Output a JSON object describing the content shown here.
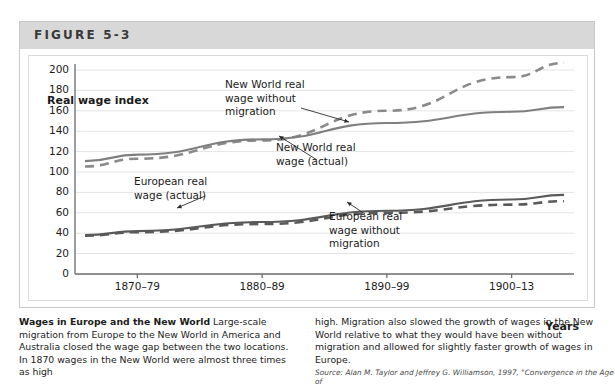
{
  "figure": {
    "label": "FIGURE 5-3"
  },
  "chart_data": {
    "type": "line",
    "title": "",
    "xlabel": "Years",
    "ylabel": "Real wage index",
    "categories": [
      "1870–79",
      "1880–89",
      "1890–99",
      "1900–13"
    ],
    "ylim": [
      0,
      200
    ],
    "ytick_step": 20,
    "yticks": [
      200,
      180,
      160,
      140,
      120,
      100,
      80,
      60,
      40,
      20,
      0
    ],
    "grid": true,
    "legend_position": "inline-annotations",
    "series": [
      {
        "name": "New World real wage without migration",
        "style": "dashed",
        "color": "#8a8a8a",
        "values": [
          113,
          131,
          160,
          193
        ]
      },
      {
        "name": "New World real wage (actual)",
        "style": "solid",
        "color": "#7f7f7f",
        "values": [
          117,
          132,
          148,
          159
        ]
      },
      {
        "name": "European real wage (actual)",
        "style": "solid",
        "color": "#5a5a5a",
        "values": [
          42,
          51,
          62,
          73
        ]
      },
      {
        "name": "European real wage without migration",
        "style": "dashed",
        "color": "#595959",
        "values": [
          41,
          49,
          60,
          68
        ]
      }
    ],
    "annotations": [
      {
        "id": "nw-without",
        "text": "New World real\nwage without\nmigration"
      },
      {
        "id": "nw-actual",
        "text": "New World real\nwage (actual)"
      },
      {
        "id": "eu-actual",
        "text": "European real\nwage (actual)"
      },
      {
        "id": "eu-without",
        "text": "European real\nwage without\nmigration"
      }
    ]
  },
  "axis": {
    "y_title": "Real wage\nindex",
    "x_title": "Years",
    "y_ticks": [
      "200",
      "180",
      "160",
      "140",
      "120",
      "100",
      "80",
      "60",
      "40",
      "20",
      "0"
    ],
    "x_ticks": [
      "1870–79",
      "1880–89",
      "1890–99",
      "1900–13"
    ]
  },
  "caption": {
    "title": "Wages in Europe and the New World",
    "left_text": " Large-scale migration from Europe to the New World in America and Australia closed the wage gap between the two locations. In 1870 wages in the New World were almost three times as high",
    "right_text": "high. Migration also slowed the growth of wages in the New World relative to what they would have been without migration and allowed for slightly faster growth of wages in Europe.",
    "source": "Source: Alan M. Taylor and Jeffrey G. Williamson, 1997, \"Convergence in the Age of"
  },
  "colors": {
    "header_band": "#d8d8d8",
    "box_border": "#c9c9c9",
    "grid_line": "#e4e4e4",
    "axis_line": "#6b6b6b",
    "new_world_line": "#7f7f7f",
    "europe_line": "#5a5a5a",
    "text": "#1b1b1b"
  }
}
